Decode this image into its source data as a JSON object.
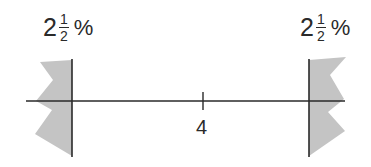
{
  "diagram": {
    "left_label": {
      "whole": "2",
      "numerator": "1",
      "denominator": "2",
      "unit": "%"
    },
    "right_label": {
      "whole": "2",
      "numerator": "1",
      "denominator": "2",
      "unit": "%"
    },
    "center_tick_label": "4",
    "colors": {
      "line": "#2a2a2a",
      "shade": "#c4c4c4",
      "background": "#ffffff"
    }
  }
}
